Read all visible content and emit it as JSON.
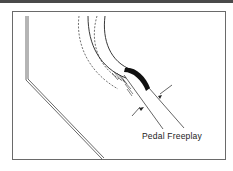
{
  "diagram": {
    "labels": {
      "callout": "Pedal Freeplay"
    },
    "colors": {
      "line": "#333333",
      "frame": "#6a6a6a",
      "pad": "#111111"
    }
  }
}
